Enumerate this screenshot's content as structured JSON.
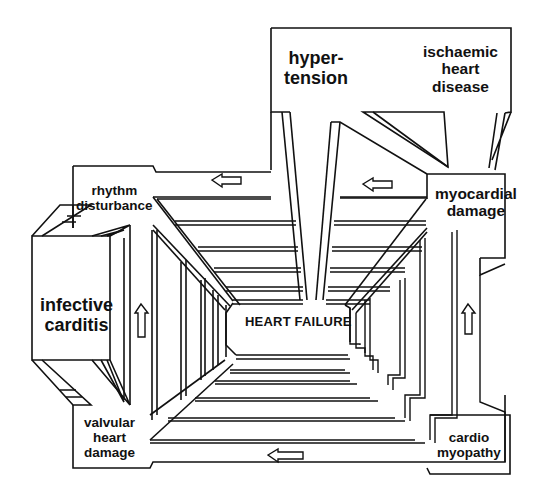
{
  "diagram": {
    "colors": {
      "line": "#111111",
      "background": "#ffffff"
    },
    "center": {
      "label": "HEART FAILURE"
    },
    "nodes": [
      {
        "id": "hypertension",
        "label": "hyper-\ntension"
      },
      {
        "id": "ischaemic_heart_disease",
        "label": "ischaemic\nheart\ndisease"
      },
      {
        "id": "myocardial_damage",
        "label": "myocardial\ndamage"
      },
      {
        "id": "rhythm_disturbance",
        "label": "rhythm\ndisturbance"
      },
      {
        "id": "infective_carditis",
        "label": "infective\ncarditis"
      },
      {
        "id": "valvular_heart_damage",
        "label": "valvular\nheart\ndamage"
      },
      {
        "id": "cardiomyopathy",
        "label": "cardio\nmyopathy"
      }
    ],
    "arrows": [
      {
        "id": "arrow-top-left",
        "direction": "left",
        "icon": "arrow-left-icon"
      },
      {
        "id": "arrow-top-right",
        "direction": "left",
        "icon": "arrow-left-icon"
      },
      {
        "id": "arrow-left-up",
        "direction": "up",
        "icon": "arrow-up-icon"
      },
      {
        "id": "arrow-right-up",
        "direction": "up",
        "icon": "arrow-up-icon"
      },
      {
        "id": "arrow-bottom-left",
        "direction": "left",
        "icon": "arrow-left-icon"
      }
    ]
  }
}
